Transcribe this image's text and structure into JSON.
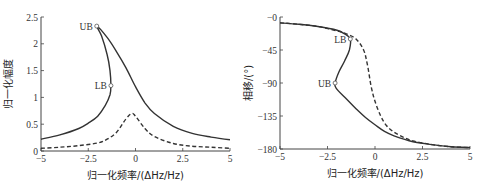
{
  "chart_data": [
    {
      "type": "line",
      "title": "",
      "xlabel": "归一化频率/(ΔHz/Hz)",
      "ylabel": "归一化幅度",
      "xlim": [
        -5,
        5
      ],
      "ylim": [
        0,
        2.5
      ],
      "xticks": [
        "-5",
        "-2.5",
        "0",
        "2.5",
        "5"
      ],
      "yticks": [
        "0",
        "0.5",
        "1",
        "1.5",
        "2",
        "2.5"
      ],
      "grid": false,
      "series": [
        {
          "name": "solid",
          "style": "solid",
          "x": [
            -5,
            -4,
            -3,
            -2.5,
            -2,
            -1.6,
            -1.35,
            -1.3,
            -1.35,
            -1.5,
            -1.8,
            -2.05,
            -1.5,
            -1,
            -0.5,
            0,
            0.5,
            1,
            2,
            3,
            4,
            5
          ],
          "y": [
            0.22,
            0.3,
            0.42,
            0.52,
            0.65,
            0.85,
            1.05,
            1.22,
            1.5,
            1.8,
            2.15,
            2.33,
            2.12,
            1.85,
            1.55,
            1.2,
            0.9,
            0.7,
            0.46,
            0.33,
            0.26,
            0.21
          ]
        },
        {
          "name": "dashed",
          "style": "dashed",
          "x": [
            -5,
            -4,
            -3,
            -2,
            -1.5,
            -1,
            -0.5,
            -0.2,
            0,
            0.5,
            1,
            2,
            3,
            4,
            5
          ],
          "y": [
            0.05,
            0.07,
            0.1,
            0.15,
            0.22,
            0.35,
            0.6,
            0.7,
            0.65,
            0.42,
            0.27,
            0.14,
            0.09,
            0.07,
            0.05
          ]
        }
      ],
      "annotations": [
        {
          "text": "UB",
          "x": -2.05,
          "y": 2.33
        },
        {
          "text": "LB",
          "x": -1.3,
          "y": 1.22
        }
      ]
    },
    {
      "type": "line",
      "title": "",
      "xlabel": "归一化频率/(ΔHz/Hz)",
      "ylabel": "相移/(°)",
      "xlim": [
        -5,
        5
      ],
      "ylim": [
        -180,
        0
      ],
      "xticks": [
        "-5",
        "-2.5",
        "0",
        "2.5",
        "5"
      ],
      "yticks": [
        "-0",
        "-45",
        "-90",
        "-135",
        "-180"
      ],
      "grid": false,
      "series": [
        {
          "name": "solid",
          "style": "solid",
          "x": [
            -5,
            -4,
            -3,
            -2,
            -1.6,
            -1.3,
            -1.35,
            -1.6,
            -1.9,
            -2.1,
            -2.05,
            -1.5,
            -1,
            -0.5,
            0,
            0.5,
            1,
            2,
            3,
            4,
            5
          ],
          "y": [
            -8,
            -10,
            -13,
            -18,
            -23,
            -30,
            -45,
            -60,
            -75,
            -90,
            -97,
            -112,
            -125,
            -137,
            -147,
            -156,
            -162,
            -170,
            -174,
            -177,
            -178
          ]
        },
        {
          "name": "dashed",
          "style": "dashed",
          "x": [
            -5,
            -4,
            -3,
            -2,
            -1.5,
            -1,
            -0.6,
            -0.4,
            -0.2,
            0,
            0.3,
            0.6,
            1,
            1.5,
            2,
            3,
            4,
            5
          ],
          "y": [
            -8,
            -10,
            -13,
            -19,
            -23,
            -30,
            -45,
            -65,
            -95,
            -115,
            -135,
            -148,
            -157,
            -164,
            -169,
            -174,
            -177,
            -178
          ]
        }
      ],
      "annotations": [
        {
          "text": "LB",
          "x": -1.3,
          "y": -30
        },
        {
          "text": "UB",
          "x": -2.1,
          "y": -90
        }
      ]
    }
  ]
}
